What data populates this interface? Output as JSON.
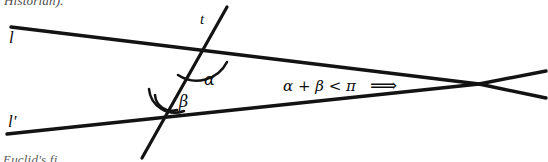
{
  "figure": {
    "caption_above_partial": "Historian).",
    "caption_below_partial": "Euclid's fi",
    "lines": {
      "l_label": "l",
      "l_prime_label": "l'",
      "transversal_label": "t"
    },
    "angles": {
      "alpha_label": "α",
      "beta_label": "β"
    },
    "annotation": {
      "inequality": "α + β < π",
      "implication_arrow": "⟹"
    },
    "colors": {
      "ink": "#131313",
      "background": "#ffffff"
    }
  },
  "geometry": {
    "line_l": {
      "x1": 11,
      "y1": 27,
      "x2": 546,
      "y2": 98
    },
    "line_l_prime": {
      "x1": 7,
      "y1": 134,
      "x2": 546,
      "y2": 71
    },
    "transversal": {
      "x1": 227,
      "y1": 7,
      "x2": 142,
      "y2": 158
    },
    "intersection_upper": {
      "x": 193,
      "y": 48
    },
    "intersection_lower": {
      "x": 160,
      "y": 110
    },
    "convergence_point": {
      "x": 479,
      "y": 84
    }
  }
}
